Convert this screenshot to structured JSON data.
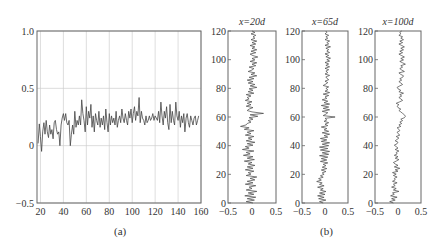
{
  "figure": {
    "caption_a": "(a)",
    "caption_b": "(b)"
  },
  "chart_data": [
    {
      "id": "a",
      "type": "line",
      "title": "",
      "xlabel": "",
      "ylabel": "",
      "xlim": [
        17,
        160
      ],
      "ylim": [
        -0.5,
        1.0
      ],
      "xticks": [
        20,
        40,
        60,
        80,
        100,
        120,
        140,
        160
      ],
      "xtick_labels": [
        "20",
        "40",
        "60",
        "80",
        "100",
        "120",
        "140",
        "160"
      ],
      "yticks": [
        -0.5,
        0,
        0.5,
        1.0
      ],
      "ytick_labels": [
        "−0.5",
        "0",
        "0.5",
        "1.0"
      ],
      "grid": true,
      "series": [
        {
          "name": "signal",
          "x": [
            18,
            19,
            20,
            21,
            22,
            23,
            24,
            25,
            26,
            27,
            28,
            29,
            30,
            31,
            32,
            33,
            34,
            35,
            36,
            37,
            38,
            39,
            40,
            41,
            42,
            43,
            44,
            45,
            46,
            47,
            48,
            49,
            50,
            51,
            52,
            53,
            54,
            55,
            56,
            57,
            58,
            59,
            60,
            61,
            62,
            63,
            64,
            65,
            66,
            67,
            68,
            69,
            70,
            71,
            72,
            73,
            74,
            75,
            76,
            77,
            78,
            79,
            80,
            81,
            82,
            83,
            84,
            85,
            86,
            87,
            88,
            89,
            90,
            91,
            92,
            93,
            94,
            95,
            96,
            97,
            98,
            99,
            100,
            101,
            102,
            103,
            104,
            105,
            106,
            107,
            108,
            109,
            110,
            111,
            112,
            113,
            114,
            115,
            116,
            117,
            118,
            119,
            120,
            121,
            122,
            123,
            124,
            125,
            126,
            127,
            128,
            129,
            130,
            131,
            132,
            133,
            134,
            135,
            136,
            137,
            138,
            139,
            140,
            141,
            142,
            143,
            144,
            145,
            146,
            147,
            148,
            149,
            150,
            151,
            152,
            153,
            154,
            155,
            156,
            157,
            158,
            159,
            160
          ],
          "y": [
            0.02,
            0.19,
            0.08,
            -0.05,
            0.12,
            0.2,
            0.1,
            0.22,
            0.12,
            0.07,
            0.18,
            0.1,
            0.14,
            0.06,
            0.2,
            0.22,
            0.14,
            0.1,
            0.12,
            0.0,
            0.18,
            0.24,
            0.28,
            0.22,
            0.28,
            0.2,
            0.18,
            0.22,
            0.0,
            0.1,
            0.18,
            0.1,
            0.3,
            0.16,
            0.22,
            0.18,
            0.26,
            0.18,
            0.4,
            0.28,
            0.22,
            0.12,
            0.34,
            0.18,
            0.3,
            0.24,
            0.36,
            0.16,
            0.26,
            0.12,
            0.28,
            0.22,
            0.18,
            0.3,
            0.16,
            0.24,
            0.18,
            0.26,
            0.14,
            0.32,
            0.2,
            0.12,
            0.28,
            0.18,
            0.26,
            0.2,
            0.24,
            0.18,
            0.3,
            0.16,
            0.22,
            0.26,
            0.2,
            0.32,
            0.24,
            0.2,
            0.28,
            0.22,
            0.18,
            0.3,
            0.24,
            0.32,
            0.2,
            0.28,
            0.34,
            0.22,
            0.3,
            0.26,
            0.42,
            0.2,
            0.3,
            0.24,
            0.22,
            0.18,
            0.26,
            0.2,
            0.22,
            0.26,
            0.22,
            0.24,
            0.28,
            0.22,
            0.26,
            0.24,
            0.22,
            0.3,
            0.2,
            0.38,
            0.26,
            0.18,
            0.3,
            0.24,
            0.34,
            0.2,
            0.14,
            0.36,
            0.2,
            0.3,
            0.22,
            0.18,
            0.38,
            0.26,
            0.22,
            0.3,
            0.16,
            0.26,
            0.2,
            0.28,
            0.12,
            0.24,
            0.28,
            0.2,
            0.16,
            0.26,
            0.22,
            0.18,
            0.24,
            0.26,
            0.18,
            0.22,
            0.26
          ]
        }
      ]
    },
    {
      "id": "b1",
      "type": "line",
      "title": "x=20d",
      "xlim": [
        -0.5,
        0.5
      ],
      "ylim": [
        0,
        120
      ],
      "xticks": [
        -0.5,
        0,
        0.5
      ],
      "xtick_labels": [
        "−0.5",
        "0",
        "0.5"
      ],
      "yticks": [
        0,
        20,
        40,
        60,
        80,
        100,
        120
      ],
      "ytick_labels": [
        "0",
        "20",
        "40",
        "60",
        "80",
        "100",
        "120"
      ],
      "grid": false,
      "series": [
        {
          "name": "profile",
          "values": [
            0.02,
            -0.12,
            0.05,
            -0.1,
            0.08,
            -0.15,
            0.04,
            -0.08,
            0.1,
            -0.12,
            0.0,
            -0.06,
            0.08,
            -0.14,
            0.02,
            -0.1,
            0.06,
            -0.04,
            0.1,
            -0.12,
            -0.02,
            -0.08,
            0.04,
            -0.14,
            0.02,
            -0.1,
            0.06,
            -0.08,
            0.0,
            -0.16,
            0.05,
            -0.1,
            0.02,
            -0.18,
            -0.04,
            -0.12,
            0.04,
            -0.2,
            -0.06,
            -0.14,
            0.02,
            -0.1,
            0.06,
            -0.12,
            0.0,
            -0.08,
            0.04,
            -0.14,
            -0.02,
            -0.1,
            0.04,
            -0.16,
            -0.06,
            -0.24,
            -0.12,
            -0.1,
            -0.02,
            -0.08,
            0.02,
            -0.06,
            0.12,
            -0.04,
            0.24,
            0.0,
            -0.1,
            -0.06,
            0.02,
            -0.12,
            -0.02,
            -0.1,
            0.0,
            -0.14,
            -0.06,
            -0.1,
            -0.02,
            -0.12,
            0.04,
            -0.08,
            0.02,
            -0.06,
            0.1,
            -0.04,
            0.06,
            -0.08,
            0.02,
            -0.1,
            0.04,
            -0.06,
            0.1,
            -0.02,
            0.06,
            -0.08,
            0.0,
            0.04,
            -0.06,
            0.08,
            0.0,
            0.1,
            -0.04,
            0.06,
            0.0,
            0.12,
            0.02,
            -0.04,
            0.08,
            -0.02,
            0.1,
            0.0,
            0.06,
            -0.04,
            0.08,
            0.0,
            0.1,
            -0.02,
            0.06,
            0.02,
            0.08,
            -0.02,
            0.06,
            0.0
          ]
        }
      ]
    },
    {
      "id": "b2",
      "type": "line",
      "title": "x=65d",
      "xlim": [
        -0.5,
        0.5
      ],
      "ylim": [
        0,
        120
      ],
      "xticks": [
        -0.5,
        0,
        0.5
      ],
      "xtick_labels": [
        "−0.5",
        "0",
        "0.5"
      ],
      "yticks": [
        0,
        20,
        40,
        60,
        80,
        100,
        120
      ],
      "ytick_labels": [
        "0",
        "20",
        "40",
        "60",
        "80",
        "100",
        "120"
      ],
      "grid": false,
      "series": [
        {
          "name": "profile",
          "values": [
            -0.04,
            -0.12,
            0.02,
            -0.14,
            -0.02,
            -0.16,
            0.0,
            -0.12,
            0.02,
            -0.1,
            -0.04,
            -0.16,
            -0.02,
            -0.12,
            -0.06,
            -0.18,
            -0.08,
            -0.14,
            -0.04,
            -0.1,
            -0.02,
            -0.06,
            0.02,
            -0.08,
            0.04,
            -0.06,
            0.02,
            -0.04,
            0.06,
            -0.1,
            0.04,
            -0.08,
            0.06,
            -0.12,
            0.08,
            -0.06,
            0.1,
            -0.1,
            0.06,
            -0.12,
            0.08,
            -0.06,
            0.1,
            -0.08,
            0.04,
            -0.1,
            0.06,
            -0.02,
            0.1,
            -0.06,
            0.08,
            -0.02,
            0.04,
            -0.08,
            0.06,
            0.0,
            0.08,
            -0.02,
            0.04,
            0.0,
            0.22,
            -0.04,
            0.02,
            0.06,
            -0.06,
            0.1,
            -0.04,
            0.08,
            -0.08,
            0.1,
            -0.02,
            0.06,
            -0.06,
            0.04,
            0.0,
            0.08,
            -0.04,
            0.1,
            0.0,
            0.06,
            0.02,
            0.08,
            -0.04,
            0.02,
            0.06,
            0.0,
            0.08,
            0.04,
            0.02,
            0.1,
            0.0,
            0.06,
            0.02,
            0.08,
            0.0,
            0.1,
            0.02,
            0.08,
            0.0,
            0.1,
            0.04,
            0.12,
            0.02,
            0.08,
            0.0,
            0.1,
            0.04,
            0.08,
            0.02,
            0.12,
            0.0,
            0.08,
            0.04,
            0.1,
            0.0,
            0.06,
            0.02,
            0.08,
            0.0,
            0.04,
            0.02
          ]
        }
      ]
    },
    {
      "id": "b3",
      "type": "line",
      "title": "x=100d",
      "xlim": [
        -0.5,
        0.5
      ],
      "ylim": [
        0,
        120
      ],
      "xticks": [
        -0.5,
        0,
        0.5
      ],
      "xtick_labels": [
        "−0.5",
        "0",
        "0.5"
      ],
      "yticks": [
        0,
        20,
        40,
        60,
        80,
        100,
        120
      ],
      "ytick_labels": [
        "0",
        "20",
        "40",
        "60",
        "80",
        "100",
        "120"
      ],
      "grid": false,
      "series": [
        {
          "name": "profile",
          "values": [
            -0.1,
            -0.18,
            -0.06,
            -0.14,
            -0.02,
            -0.16,
            -0.08,
            -0.12,
            0.02,
            -0.1,
            -0.04,
            -0.14,
            -0.06,
            -0.1,
            -0.02,
            -0.12,
            -0.06,
            -0.08,
            -0.02,
            -0.1,
            -0.04,
            -0.12,
            0.0,
            -0.06,
            0.04,
            -0.08,
            0.0,
            -0.06,
            -0.1,
            -0.04,
            0.02,
            -0.06,
            0.0,
            -0.08,
            -0.02,
            -0.04,
            0.02,
            -0.06,
            0.0,
            -0.04,
            -0.08,
            -0.02,
            0.0,
            -0.06,
            -0.02,
            0.02,
            -0.04,
            0.04,
            0.0,
            -0.02,
            0.04,
            0.02,
            -0.02,
            0.06,
            0.02,
            0.08,
            0.04,
            0.1,
            0.06,
            0.14,
            0.16,
            0.14,
            0.1,
            0.06,
            0.02,
            0.06,
            0.0,
            -0.02,
            0.02,
            -0.04,
            0.04,
            0.1,
            0.06,
            0.02,
            0.08,
            0.04,
            0.12,
            0.02,
            0.06,
            0.0,
            -0.02,
            0.04,
            0.1,
            0.06,
            0.02,
            0.08,
            0.04,
            0.1,
            0.12,
            0.06,
            0.02,
            0.14,
            0.08,
            0.04,
            0.1,
            0.06,
            0.16,
            0.1,
            0.04,
            0.12,
            0.06,
            0.14,
            0.08,
            0.02,
            0.1,
            0.04,
            0.12,
            0.06,
            0.14,
            0.08,
            0.02,
            0.1,
            0.04,
            0.12,
            0.06,
            0.1,
            0.02,
            0.06,
            0.04,
            0.08
          ]
        }
      ]
    }
  ]
}
